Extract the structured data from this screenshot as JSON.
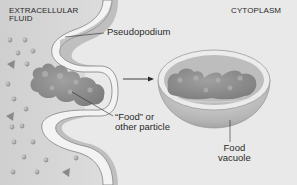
{
  "diagram": {
    "regions": {
      "extracellular": {
        "line1": "EXTRACELLULAR",
        "line2": "FLUID"
      },
      "cytoplasm": "CYTOPLASM"
    },
    "labels": {
      "pseudopodium": "Pseudopodium",
      "food_particle": {
        "line1": "“Food” or",
        "line2": "other particle"
      },
      "food_vacuole": {
        "line1": "Food",
        "line2": "vacuole"
      }
    },
    "colors": {
      "background": "#e9e9e9",
      "extracellular_fluid": "#d2d2d2",
      "membrane": "#f2f2f2",
      "membrane_edge": "#8a8a8a",
      "food": "#8c8c8c",
      "molecules": "#9a9a9a",
      "text": "#2a2a2a"
    }
  }
}
